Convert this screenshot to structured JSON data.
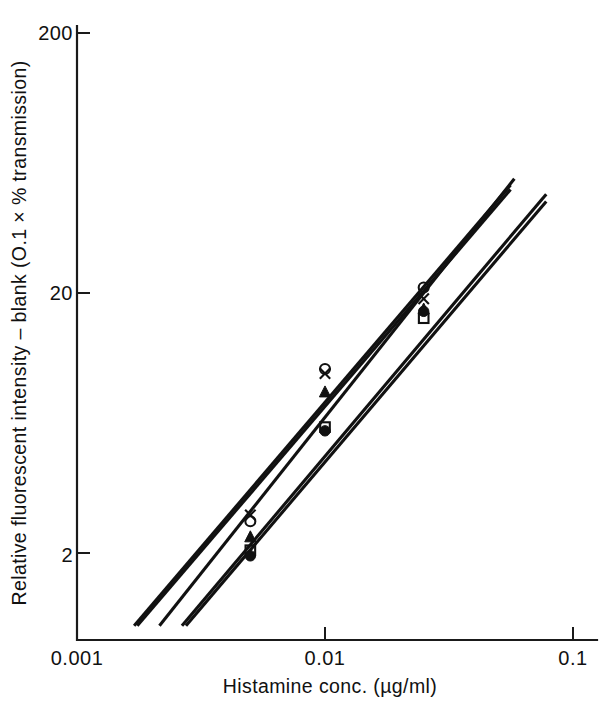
{
  "chart_data": {
    "type": "line",
    "title": "",
    "xlabel": "Histamine conc. (µg/ml)",
    "ylabel": "Relative fluorescent intensity – blank (O.1 × % transmission)",
    "xscale": "log",
    "yscale": "log",
    "xlim": [
      0.001,
      0.13
    ],
    "ylim": [
      1.05,
      260
    ],
    "xticks": [
      0.001,
      0.01,
      0.1
    ],
    "xticklabels": [
      "0.001",
      "0.01",
      "0.1"
    ],
    "yticks": [
      2,
      20,
      200
    ],
    "yticklabels": [
      "2",
      "20",
      "200"
    ],
    "grid": false,
    "legend": "none",
    "series": [
      {
        "name": "open-circle",
        "marker": "open-circle",
        "x": [
          0.005,
          0.01,
          0.025
        ],
        "y": [
          2.65,
          10.2,
          21.0
        ],
        "line_x": [
          0.0017,
          0.056
        ],
        "line_y": [
          1.05,
          52.0
        ]
      },
      {
        "name": "cross",
        "marker": "cross",
        "x": [
          0.005,
          0.01,
          0.025
        ],
        "y": [
          2.8,
          9.8,
          19.0
        ],
        "line_x": [
          0.00175,
          0.056
        ],
        "line_y": [
          1.05,
          50.0
        ]
      },
      {
        "name": "filled-triangle",
        "marker": "filled-triangle",
        "x": [
          0.005,
          0.01,
          0.025
        ],
        "y": [
          2.3,
          8.3,
          17.3
        ],
        "line_x": [
          0.00215,
          0.058
        ],
        "line_y": [
          1.05,
          55.0
        ]
      },
      {
        "name": "open-square",
        "marker": "open-square",
        "x": [
          0.005,
          0.01,
          0.025
        ],
        "y": [
          2.05,
          6.1,
          16.0
        ],
        "line_x": [
          0.00265,
          0.078
        ],
        "line_y": [
          1.05,
          48.0
        ]
      },
      {
        "name": "filled-circle",
        "marker": "filled-circle",
        "x": [
          0.005,
          0.01,
          0.025
        ],
        "y": [
          1.95,
          5.9,
          17.0
        ],
        "line_x": [
          0.00275,
          0.078
        ],
        "line_y": [
          1.05,
          45.0
        ]
      }
    ]
  },
  "axes": {
    "y_tick_200": "200",
    "y_tick_20": "20",
    "y_tick_2": "2",
    "x_tick_0001": "0.001",
    "x_tick_001": "0.01",
    "x_tick_01": "0.1",
    "x_axis_title": "Histamine  conc. (µg/ml)",
    "y_axis_title": "Relative  fluorescent  intensity  –  blank  (O.1  ×  %  transmission)"
  }
}
